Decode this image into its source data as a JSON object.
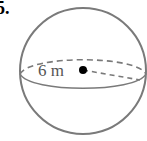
{
  "problem": {
    "number": "5."
  },
  "figure": {
    "shape": "sphere",
    "radius_label": "6 m",
    "stroke_color": "#7a7a7a",
    "center_dot_color": "#000000"
  }
}
